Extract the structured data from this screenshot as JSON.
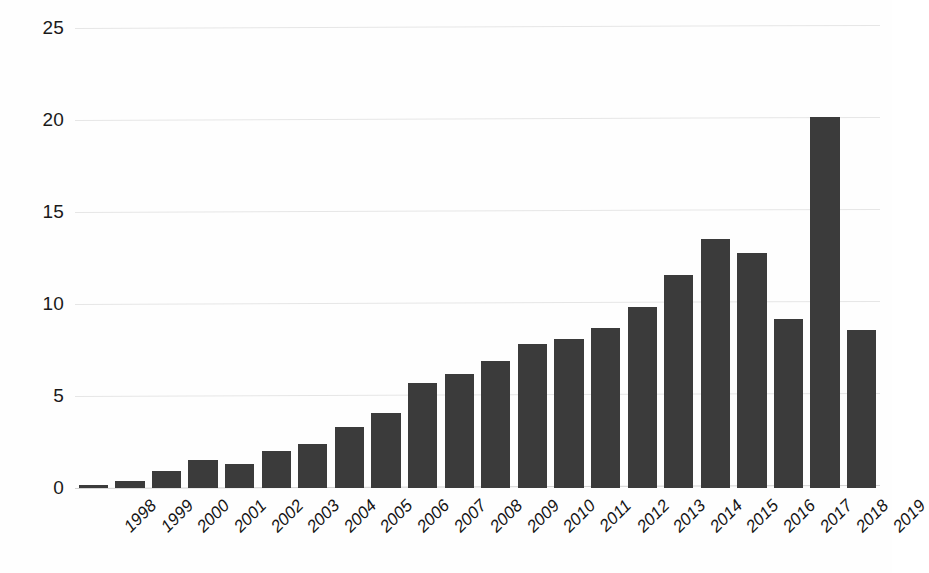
{
  "chart_data": {
    "type": "bar",
    "title": "",
    "subtitle": "",
    "xlabel": "",
    "ylabel": "",
    "categories": [
      "1998",
      "1999",
      "2000",
      "2001",
      "2002",
      "2003",
      "2004",
      "2005",
      "2006",
      "2007",
      "2008",
      "2009",
      "2010",
      "2011",
      "2012",
      "2013",
      "2014",
      "2015",
      "2016",
      "2017",
      "2018",
      "2019"
    ],
    "values": [
      0.15,
      0.4,
      0.9,
      1.5,
      1.3,
      2.0,
      2.4,
      3.3,
      4.1,
      5.7,
      6.2,
      6.9,
      7.8,
      8.1,
      8.7,
      9.85,
      11.6,
      13.55,
      12.75,
      9.2,
      20.15,
      8.6
    ],
    "series": [
      {
        "name": "",
        "values": [
          0.15,
          0.4,
          0.9,
          1.5,
          1.3,
          2.0,
          2.4,
          3.3,
          4.1,
          5.7,
          6.2,
          6.9,
          7.8,
          8.1,
          8.7,
          9.85,
          11.6,
          13.55,
          12.75,
          9.2,
          20.15,
          8.6
        ]
      }
    ],
    "ylim": [
      0,
      25
    ],
    "yticks": [
      0,
      5,
      10,
      15,
      20,
      25
    ],
    "ytick_labels": [
      "0",
      "5",
      "10",
      "15",
      "20",
      "25"
    ],
    "grid": true,
    "legend": false,
    "legend_position": "none",
    "annotations": [],
    "bar_color": "#3b3b3b",
    "gridline_color": "#e6e6e6",
    "background_color": "#ffffff",
    "axis_text_color": "#1a1a1a"
  }
}
